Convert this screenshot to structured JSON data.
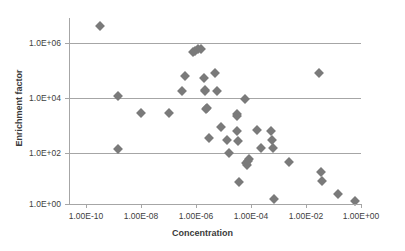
{
  "chart_data": {
    "type": "scatter",
    "title": "",
    "xlabel": "Concentration",
    "ylabel": "Enrichment factor",
    "xscale": "log",
    "yscale": "log",
    "xlim": [
      1e-11,
      10.0
    ],
    "ylim": [
      1.0,
      10000000.0
    ],
    "grid": true,
    "legend": false,
    "marker": "diamond",
    "marker_color": "#7a7a7a",
    "xticks": [
      1e-10,
      1e-08,
      1e-06,
      0.0001,
      0.01,
      1.0
    ],
    "xticklabels": [
      "1.00E-10",
      "1.00E-08",
      "1.00E-06",
      "1.00E-04",
      "1.00E-02",
      "1.00E+00"
    ],
    "yticks": [
      1.0,
      100.0,
      10000.0,
      1000000.0
    ],
    "yticklabels": [
      "1.0E+00",
      "1.0E+02",
      "1.0E+04",
      "1.0E+06"
    ],
    "series": [
      {
        "name": "data",
        "points": [
          {
            "x": 3.2e-10,
            "y": 3000000.0
          },
          {
            "x": 1.5e-09,
            "y": 8500.0
          },
          {
            "x": 1.5e-09,
            "y": 100.0
          },
          {
            "x": 1e-08,
            "y": 2000.0
          },
          {
            "x": 1e-07,
            "y": 2000.0
          },
          {
            "x": 3e-07,
            "y": 13000.0
          },
          {
            "x": 4e-07,
            "y": 45000.0
          },
          {
            "x": 8e-07,
            "y": 350000.0
          },
          {
            "x": 9.5e-07,
            "y": 380000.0
          },
          {
            "x": 1.2e-06,
            "y": 420000.0
          },
          {
            "x": 1.5e-06,
            "y": 430000.0
          },
          {
            "x": 2e-06,
            "y": 38000.0
          },
          {
            "x": 2.2e-06,
            "y": 14000.0
          },
          {
            "x": 2.2e-06,
            "y": 13000.0
          },
          {
            "x": 2.4e-06,
            "y": 2800.0
          },
          {
            "x": 2.6e-06,
            "y": 3000.0
          },
          {
            "x": 3e-06,
            "y": 260.0
          },
          {
            "x": 5e-06,
            "y": 58000.0
          },
          {
            "x": 6e-06,
            "y": 13000.0
          },
          {
            "x": 8e-06,
            "y": 650.0
          },
          {
            "x": 1.3e-05,
            "y": 210.0
          },
          {
            "x": 1.6e-05,
            "y": 72.0
          },
          {
            "x": 3e-05,
            "y": 440.0
          },
          {
            "x": 3.2e-05,
            "y": 1800.0
          },
          {
            "x": 3.2e-05,
            "y": 1600.0
          },
          {
            "x": 3.4e-05,
            "y": 200.0
          },
          {
            "x": 3.6e-05,
            "y": 6.5
          },
          {
            "x": 6e-05,
            "y": 6500.0
          },
          {
            "x": 6.5e-05,
            "y": 32.0
          },
          {
            "x": 7e-05,
            "y": 26.0
          },
          {
            "x": 8e-05,
            "y": 38.0
          },
          {
            "x": 8.5e-05,
            "y": 42.0
          },
          {
            "x": 0.00016,
            "y": 500.0
          },
          {
            "x": 0.00024,
            "y": 110.0
          },
          {
            "x": 0.00055,
            "y": 450.0
          },
          {
            "x": 0.00058,
            "y": 220.0
          },
          {
            "x": 0.00065,
            "y": 110.0
          },
          {
            "x": 0.0007,
            "y": 1.5
          },
          {
            "x": 0.0025,
            "y": 34.0
          },
          {
            "x": 0.03,
            "y": 60000.0
          },
          {
            "x": 0.035,
            "y": 15.0
          },
          {
            "x": 0.038,
            "y": 7.0
          },
          {
            "x": 0.15,
            "y": 2.3
          },
          {
            "x": 0.6,
            "y": 1.3
          }
        ]
      }
    ]
  },
  "axis": {
    "x_title": "Concentration",
    "y_title": "Enrichment factor"
  }
}
